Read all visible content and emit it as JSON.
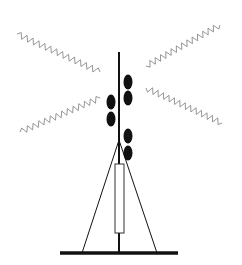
{
  "diagram": {
    "title": "",
    "colors": {
      "background": "#ffffff",
      "structure": "#111111",
      "waves": "#8a8a8a",
      "elements": "#111111"
    },
    "mast": {
      "x": 119,
      "top": 52,
      "bottom": 253
    },
    "ground": {
      "x1": 60,
      "x2": 178,
      "y": 253
    },
    "guy_wires": [
      {
        "x1": 119,
        "y1": 140,
        "x2": 82,
        "y2": 253
      },
      {
        "x1": 119,
        "y1": 140,
        "x2": 157,
        "y2": 253
      }
    ],
    "equipment_box": {
      "x": 115,
      "y": 164,
      "w": 9,
      "h": 69
    },
    "panels": [
      {
        "cx": 128,
        "cy": 82
      },
      {
        "cx": 128,
        "cy": 98
      },
      {
        "cx": 111,
        "cy": 102
      },
      {
        "cx": 111,
        "cy": 119
      },
      {
        "cx": 128,
        "cy": 136
      },
      {
        "cx": 128,
        "cy": 153
      }
    ],
    "waves": [
      {
        "name": "upper-left",
        "x1": 100,
        "y1": 72,
        "x2": 17,
        "y2": 34
      },
      {
        "name": "lower-left",
        "x1": 100,
        "y1": 98,
        "x2": 20,
        "y2": 132
      },
      {
        "name": "upper-right",
        "x1": 146,
        "y1": 66,
        "x2": 220,
        "y2": 25
      },
      {
        "name": "lower-right",
        "x1": 146,
        "y1": 88,
        "x2": 222,
        "y2": 123
      }
    ]
  }
}
